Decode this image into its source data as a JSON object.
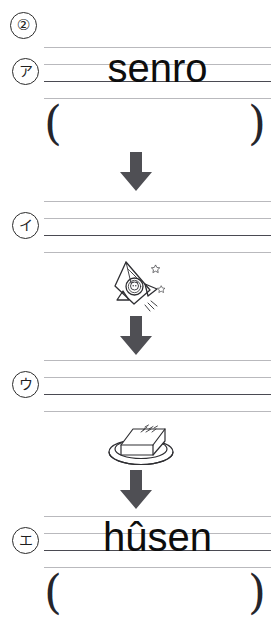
{
  "page": {
    "number_marker": "②",
    "background_color": "#ffffff",
    "ink_color": "#1a1a1a",
    "rule_light_color": "#b9b9bd",
    "rule_baseline_color": "#4a4a52",
    "arrow_color": "#4f4f54"
  },
  "items": [
    {
      "marker": "ア",
      "word": "senro",
      "has_paren_row": true,
      "paren_open": "(",
      "paren_close": ")"
    },
    {
      "marker": "イ",
      "word": "",
      "has_paren_row": false,
      "paren_open": "",
      "paren_close": ""
    },
    {
      "marker": "ウ",
      "word": "",
      "has_paren_row": false,
      "paren_open": "",
      "paren_close": ""
    },
    {
      "marker": "エ",
      "word": "hûsen",
      "has_paren_row": true,
      "paren_open": "(",
      "paren_close": ")"
    }
  ],
  "illustrations": [
    {
      "name": "rocket-with-character",
      "label": "rocket"
    },
    {
      "name": "tofu-block-on-plate",
      "label": "tofu"
    }
  ],
  "arrows": [
    {
      "name": "down-arrow-1"
    },
    {
      "name": "down-arrow-2"
    },
    {
      "name": "down-arrow-3"
    },
    {
      "name": "down-arrow-4"
    }
  ]
}
